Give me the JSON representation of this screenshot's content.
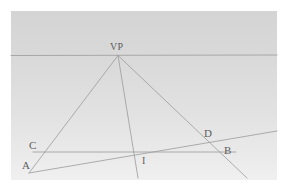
{
  "figure": {
    "panel": {
      "background_top_color": "#d4d4d4",
      "background_bottom_color": "#f0f0f0",
      "x": 11,
      "y": 11,
      "width": 266,
      "height": 169
    },
    "line_color": "#9a9a9a",
    "label_color": "#5d5d5d",
    "labels": [
      {
        "id": "vp",
        "text": "VP",
        "x": 110,
        "y": 42
      },
      {
        "id": "c",
        "text": "C",
        "x": 29,
        "y": 140
      },
      {
        "id": "a",
        "text": "A",
        "x": 22,
        "y": 160
      },
      {
        "id": "i",
        "text": "I",
        "x": 142,
        "y": 156
      },
      {
        "id": "d",
        "text": "D",
        "x": 204,
        "y": 128
      },
      {
        "id": "b",
        "text": "B",
        "x": 224,
        "y": 145
      }
    ],
    "points": {
      "VP": {
        "x": 118,
        "y": 55.5
      },
      "A": {
        "x": 30,
        "y": 171
      },
      "C": {
        "x": 34,
        "y": 152
      },
      "B": {
        "x": 235,
        "y": 152
      },
      "D": {
        "x": 212,
        "y": 136
      },
      "I": {
        "x": 140,
        "y": 152
      }
    },
    "segments": [
      {
        "id": "horizon-line",
        "name": "horizon line",
        "x1": 11,
        "y1": 55.5,
        "x2": 277,
        "y2": 55.0
      },
      {
        "id": "vp-to-a-ray",
        "name": "ray from VP through C to A",
        "x1": 118,
        "y1": 55.5,
        "x2": 29,
        "y2": 173
      },
      {
        "id": "vp-to-i-ray",
        "name": "ray from VP through I",
        "x1": 118,
        "y1": 55.5,
        "x2": 138,
        "y2": 178
      },
      {
        "id": "vp-to-b-ray",
        "name": "ray from VP through D and B",
        "x1": 118,
        "y1": 55.5,
        "x2": 247,
        "y2": 178
      },
      {
        "id": "baseline-c-b",
        "name": "horizontal baseline C to B",
        "x1": 33,
        "y1": 152,
        "x2": 236,
        "y2": 152
      },
      {
        "id": "oblique-a-d",
        "name": "oblique line from A through D",
        "x1": 29,
        "y1": 173,
        "x2": 277,
        "y2": 131
      }
    ]
  }
}
